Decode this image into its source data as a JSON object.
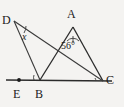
{
  "figure": {
    "type": "geometry-diagram",
    "background_color": "#f4f3f1",
    "stroke_color": "#2b2b2b",
    "width": 124,
    "height": 107,
    "points": {
      "A": {
        "label": "A",
        "x": 73,
        "y": 27
      },
      "B": {
        "label": "B",
        "x": 40,
        "y": 80
      },
      "C": {
        "label": "C",
        "x": 103,
        "y": 81
      },
      "D": {
        "label": "D",
        "x": 14,
        "y": 21
      },
      "E": {
        "label": "E",
        "x": 19,
        "y": 80
      }
    },
    "segments": [
      {
        "name": "baseline-E-C",
        "from": "E",
        "to": "C"
      },
      {
        "name": "side-A-B",
        "from": "A",
        "to": "B"
      },
      {
        "name": "side-A-C",
        "from": "A",
        "to": "C"
      },
      {
        "name": "side-D-B",
        "from": "D",
        "to": "B"
      },
      {
        "name": "side-D-C",
        "from": "D",
        "to": "C"
      }
    ],
    "angles": [
      {
        "name": "angle-at-D",
        "vertex": "D",
        "label": "x",
        "italic": true
      },
      {
        "name": "angle-at-A",
        "vertex": "A",
        "label": "56°"
      },
      {
        "name": "angle-at-B",
        "vertex": "B",
        "label": ""
      },
      {
        "name": "angle-at-C",
        "vertex": "C",
        "label": ""
      }
    ],
    "markers": [
      {
        "name": "point-marker-E",
        "at": "E"
      }
    ]
  }
}
